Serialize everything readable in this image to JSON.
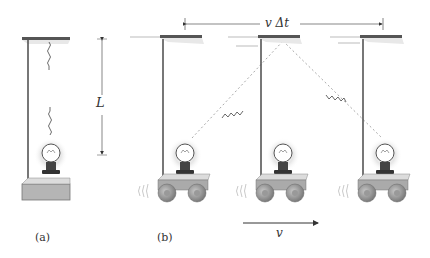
{
  "figure": {
    "panels": [
      {
        "id": "a",
        "label": "(a)",
        "description": "Stationary light clock: bulb emits light pulse up to mirror at distance L and back"
      },
      {
        "id": "b",
        "label": "(b)",
        "description": "Moving light clock on cart: light travels diagonal path while mirror moves v Δt"
      }
    ],
    "annotations": {
      "length_label": "L",
      "displacement_label": "v Δt",
      "velocity_label": "v"
    },
    "colors": {
      "mirror": "#555555",
      "pole": "#4a4a4a",
      "dashed_path": "#aaaaaa",
      "wheel": "#8a8a8a",
      "base": "#b5b5b5",
      "glow": "#cfcfcf"
    }
  }
}
